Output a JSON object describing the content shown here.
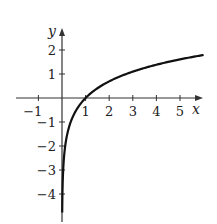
{
  "chart_data": {
    "type": "line",
    "title": "",
    "function": "y = ln(x)",
    "xlabel": "x",
    "ylabel": "y",
    "xlim": [
      -1.5,
      6
    ],
    "ylim": [
      -4.8,
      2.7
    ],
    "grid": false,
    "x_ticks": [
      -1,
      1,
      2,
      3,
      4,
      5
    ],
    "y_ticks": [
      2,
      1,
      -1,
      -2,
      -3,
      -4
    ],
    "x_tick_labels": [
      "−1",
      "1",
      "2",
      "3",
      "4",
      "5"
    ],
    "y_tick_labels": [
      "2",
      "1",
      "−1",
      "−2",
      "−3",
      "−4"
    ],
    "series": [
      {
        "name": "ln(x)",
        "x": [
          0.01,
          0.05,
          0.1,
          0.2,
          0.3,
          0.5,
          0.75,
          1,
          1.5,
          2,
          3,
          4,
          5,
          6
        ],
        "values": [
          -4.61,
          -3.0,
          -2.3,
          -1.61,
          -1.2,
          -0.69,
          -0.29,
          0,
          0.41,
          0.69,
          1.1,
          1.39,
          1.61,
          1.79
        ]
      }
    ],
    "colors": {
      "curve": "#111111",
      "axes": "#333333"
    }
  }
}
